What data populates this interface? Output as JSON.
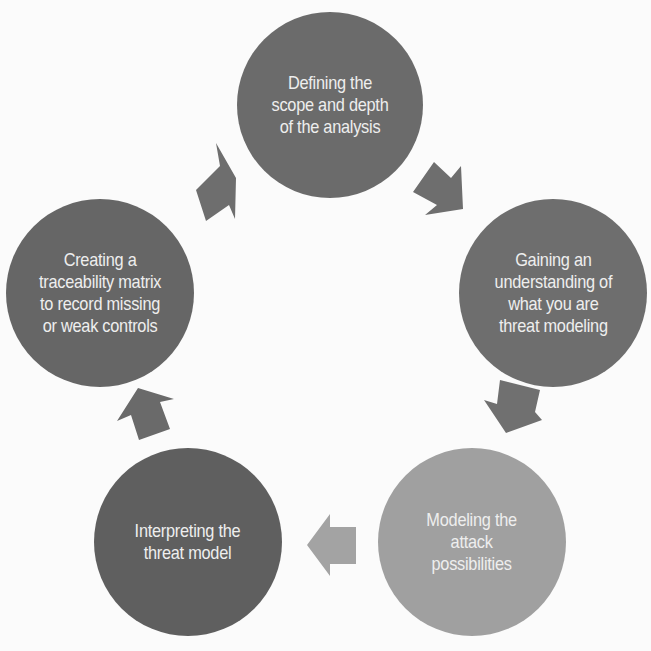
{
  "diagram": {
    "type": "cycle",
    "background": "#fbfbfb",
    "nodes": [
      {
        "id": "step-1",
        "label": "Defining the\nscope and depth\nof the analysis",
        "color": "#6b6b6b",
        "cx": 330,
        "cy": 105,
        "r": 93
      },
      {
        "id": "step-2",
        "label": "Gaining an\nunderstanding of\nwhat you are\nthreat modeling",
        "color": "#6e6e6e",
        "cx": 553,
        "cy": 293,
        "r": 94
      },
      {
        "id": "step-3",
        "label": "Modeling the\nattack\npossibilities",
        "color": "#a0a0a0",
        "cx": 472,
        "cy": 542,
        "r": 94
      },
      {
        "id": "step-4",
        "label": "Interpreting the\nthreat model",
        "color": "#5f5f5f",
        "cx": 188,
        "cy": 542,
        "r": 94
      },
      {
        "id": "step-5",
        "label": "Creating a\ntraceability matrix\nto record missing\nor weak controls",
        "color": "#666666",
        "cx": 100,
        "cy": 293,
        "r": 94
      }
    ],
    "arrows": [
      {
        "id": "arrow-5-to-1",
        "direction": "up-right",
        "color": "#6e6e6e"
      },
      {
        "id": "arrow-1-to-2",
        "direction": "down-right",
        "color": "#6e6e6e"
      },
      {
        "id": "arrow-2-to-3",
        "direction": "down",
        "color": "#707070"
      },
      {
        "id": "arrow-3-to-4",
        "direction": "left",
        "color": "#a3a3a3"
      },
      {
        "id": "arrow-4-to-5",
        "direction": "up",
        "color": "#6a6a6a"
      }
    ]
  }
}
